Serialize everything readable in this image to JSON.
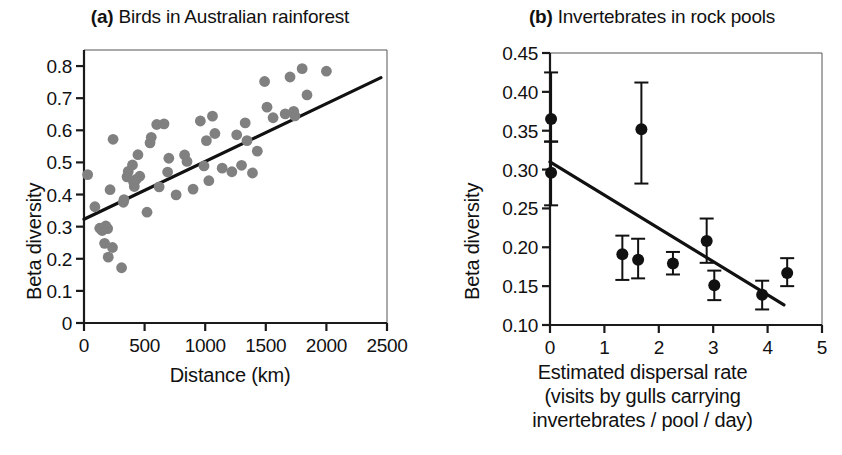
{
  "figure": {
    "panels": [
      {
        "tag": "(a)",
        "title": "Birds in Australian rainforest",
        "xlabel": "Distance (km)",
        "ylabel": "Beta diversity"
      },
      {
        "tag": "(b)",
        "title": "Invertebrates in rock pools",
        "xlabel_line1": "Estimated dispersal rate",
        "xlabel_line2": "(visits by gulls carrying",
        "xlabel_line3": "invertebrates / pool / day)",
        "ylabel": "Beta diversity"
      }
    ]
  },
  "chart_data": [
    {
      "type": "scatter",
      "panel": "a",
      "title": "Birds in Australian rainforest",
      "xlabel": "Distance (km)",
      "ylabel": "Beta diversity",
      "xlim": [
        0,
        2500
      ],
      "ylim": [
        0,
        0.85
      ],
      "xticks": [
        0,
        500,
        1000,
        1500,
        2000,
        2500
      ],
      "xticklabels": [
        "0",
        "500",
        "1000",
        "1500",
        "2000",
        "2500"
      ],
      "yticks": [
        0,
        0.1,
        0.2,
        0.3,
        0.4,
        0.5,
        0.6,
        0.7,
        0.8
      ],
      "yticklabels": [
        "0",
        "0.1",
        "0.2",
        "0.3",
        "0.4",
        "0.5",
        "0.6",
        "0.7",
        "0.8"
      ],
      "grid": false,
      "legend": "none",
      "marker_color": "#808080",
      "points": [
        [
          30,
          0.462
        ],
        [
          90,
          0.362
        ],
        [
          130,
          0.295
        ],
        [
          150,
          0.288
        ],
        [
          170,
          0.248
        ],
        [
          180,
          0.302
        ],
        [
          195,
          0.294
        ],
        [
          200,
          0.205
        ],
        [
          215,
          0.415
        ],
        [
          235,
          0.235
        ],
        [
          240,
          0.572
        ],
        [
          310,
          0.172
        ],
        [
          325,
          0.376
        ],
        [
          330,
          0.384
        ],
        [
          355,
          0.455
        ],
        [
          365,
          0.472
        ],
        [
          400,
          0.492
        ],
        [
          410,
          0.438
        ],
        [
          415,
          0.425
        ],
        [
          430,
          0.447
        ],
        [
          445,
          0.524
        ],
        [
          460,
          0.457
        ],
        [
          520,
          0.345
        ],
        [
          545,
          0.561
        ],
        [
          555,
          0.578
        ],
        [
          600,
          0.618
        ],
        [
          620,
          0.424
        ],
        [
          660,
          0.62
        ],
        [
          690,
          0.47
        ],
        [
          700,
          0.513
        ],
        [
          760,
          0.399
        ],
        [
          830,
          0.523
        ],
        [
          850,
          0.503
        ],
        [
          900,
          0.417
        ],
        [
          960,
          0.629
        ],
        [
          990,
          0.489
        ],
        [
          1010,
          0.568
        ],
        [
          1030,
          0.443
        ],
        [
          1060,
          0.644
        ],
        [
          1080,
          0.59
        ],
        [
          1140,
          0.482
        ],
        [
          1220,
          0.471
        ],
        [
          1260,
          0.586
        ],
        [
          1300,
          0.491
        ],
        [
          1330,
          0.623
        ],
        [
          1345,
          0.568
        ],
        [
          1390,
          0.467
        ],
        [
          1430,
          0.535
        ],
        [
          1490,
          0.752
        ],
        [
          1510,
          0.672
        ],
        [
          1560,
          0.639
        ],
        [
          1660,
          0.651
        ],
        [
          1700,
          0.766
        ],
        [
          1730,
          0.659
        ],
        [
          1740,
          0.645
        ],
        [
          1800,
          0.792
        ],
        [
          1840,
          0.71
        ],
        [
          2000,
          0.784
        ]
      ],
      "trend": {
        "x0": 0,
        "y0": 0.323,
        "x1": 2450,
        "y1": 0.764
      }
    },
    {
      "type": "scatter",
      "panel": "b",
      "title": "Invertebrates in rock pools",
      "xlabel": "Estimated dispersal rate (visits by gulls carrying invertebrates / pool / day)",
      "ylabel": "Beta diversity",
      "xlim": [
        0,
        5
      ],
      "ylim": [
        0.1,
        0.45
      ],
      "xticks": [
        0,
        1,
        2,
        3,
        4,
        5
      ],
      "xticklabels": [
        "0",
        "1",
        "2",
        "3",
        "4",
        "5"
      ],
      "yticks": [
        0.1,
        0.15,
        0.2,
        0.25,
        0.3,
        0.35,
        0.4,
        0.45
      ],
      "yticklabels": [
        "0.10",
        "0.15",
        "0.20",
        "0.25",
        "0.30",
        "0.35",
        "0.40",
        "0.45"
      ],
      "grid": false,
      "legend": "none",
      "marker_color": "#111111",
      "points_with_error": [
        {
          "x": 0.02,
          "y": 0.365,
          "lo": 0.336,
          "hi": 0.425
        },
        {
          "x": 0.02,
          "y": 0.296,
          "lo": 0.254,
          "hi": 0.336
        },
        {
          "x": 1.33,
          "y": 0.191,
          "lo": 0.158,
          "hi": 0.215
        },
        {
          "x": 1.62,
          "y": 0.184,
          "lo": 0.16,
          "hi": 0.211
        },
        {
          "x": 1.68,
          "y": 0.352,
          "lo": 0.282,
          "hi": 0.412
        },
        {
          "x": 2.26,
          "y": 0.179,
          "lo": 0.165,
          "hi": 0.194
        },
        {
          "x": 2.88,
          "y": 0.208,
          "lo": 0.18,
          "hi": 0.237
        },
        {
          "x": 3.02,
          "y": 0.151,
          "lo": 0.132,
          "hi": 0.17
        },
        {
          "x": 3.9,
          "y": 0.139,
          "lo": 0.12,
          "hi": 0.157
        },
        {
          "x": 4.36,
          "y": 0.167,
          "lo": 0.15,
          "hi": 0.186
        }
      ],
      "trend": {
        "x0": 0.0,
        "y0": 0.31,
        "x1": 4.3,
        "y1": 0.126
      }
    }
  ]
}
